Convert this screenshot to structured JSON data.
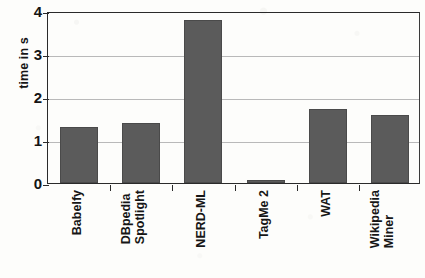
{
  "chart_data": {
    "type": "bar",
    "title": "",
    "subtitle": "",
    "xlabel": "",
    "ylabel": "time in s",
    "categories": [
      "Babelfy",
      "DBpedia Spotlight",
      "NERD-ML",
      "TagMe 2",
      "WAT",
      "Wikipedia Miner"
    ],
    "category_lines": [
      [
        "Babelfy"
      ],
      [
        "DBpedia",
        "Spotlight"
      ],
      [
        "NERD-ML"
      ],
      [
        "TagMe 2"
      ],
      [
        "WAT"
      ],
      [
        "Wikipedia",
        "Miner"
      ]
    ],
    "values": [
      1.3,
      1.4,
      3.78,
      0.08,
      1.72,
      1.58
    ],
    "ylim": [
      0,
      4
    ],
    "yticks": [
      0,
      1,
      2,
      3,
      4
    ],
    "ytick_labels": [
      "0",
      "1",
      "2",
      "3",
      "4"
    ],
    "grid": true,
    "grid_axis": "y",
    "legend": false,
    "legend_position": "none",
    "bar_color": "#5b5b5b",
    "axis_color": "#2a2a2a",
    "gridline_color": "#b9b9b9",
    "background_color": "#fdfdfb"
  }
}
